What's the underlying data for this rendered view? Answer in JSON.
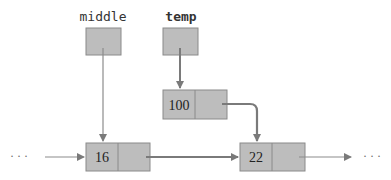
{
  "variables": [
    {
      "name": "middle"
    },
    {
      "name": "temp"
    }
  ],
  "nodes": [
    {
      "id": "new_node",
      "value": "100"
    },
    {
      "id": "node_a",
      "value": "16"
    },
    {
      "id": "node_b",
      "value": "22"
    }
  ],
  "ellipsis": {
    "left": "· · ·",
    "right": "· · ·"
  },
  "colors": {
    "box_fill": "#bdbdbd",
    "box_stroke": "#8a8a8a",
    "arrow": "#7a7a7a",
    "thin_arrow": "#8c8c8c"
  }
}
